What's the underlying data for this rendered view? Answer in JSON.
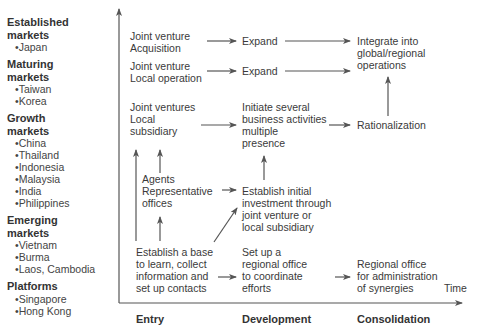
{
  "markets": [
    {
      "title": [
        "Established",
        "markets"
      ],
      "items": [
        "Japan"
      ]
    },
    {
      "title": [
        "Maturing",
        "markets"
      ],
      "items": [
        "Taiwan",
        "Korea"
      ]
    },
    {
      "title": [
        "Growth",
        "markets"
      ],
      "items": [
        "China",
        "Thailand",
        "Indonesia",
        "Malaysia",
        "India",
        "Philippines"
      ]
    },
    {
      "title": [
        "Emerging",
        "markets"
      ],
      "items": [
        "Vietnam",
        "Burma",
        "Laos, Cambodia"
      ]
    },
    {
      "title": [
        "Platforms"
      ],
      "items": [
        "Singapore",
        "Hong Kong"
      ]
    }
  ],
  "nodes": {
    "jv_acq": [
      "Joint venture",
      "Acquisition"
    ],
    "expand1": [
      "Expand"
    ],
    "integrate": [
      "Integrate into",
      "global/regional",
      "operations"
    ],
    "jv_local": [
      "Joint venture",
      "Local operation"
    ],
    "expand2": [
      "Expand"
    ],
    "jv_subs": [
      "Joint ventures",
      "Local",
      "subsidiary"
    ],
    "initiate": [
      "Initiate several",
      "business activities",
      "multiple",
      "presence"
    ],
    "rational": [
      "Rationalization"
    ],
    "agents": [
      "Agents",
      "Representative",
      "offices"
    ],
    "establish_init": [
      "Establish initial",
      "investment through",
      "joint venture or",
      "local subsidiary"
    ],
    "establish_base": [
      "Establish a base",
      "to learn, collect",
      "information and",
      "set up contacts"
    ],
    "setup_regional": [
      "Set up a",
      "regional office",
      "to coordinate",
      "efforts"
    ],
    "regional_admin": [
      "Regional office",
      "for administration",
      "of synergies"
    ]
  },
  "axis": {
    "x_label": "Time",
    "phases": [
      "Entry",
      "Development",
      "Consolidation"
    ]
  },
  "colors": {
    "line": "#555555",
    "text": "#3a3a3a"
  }
}
